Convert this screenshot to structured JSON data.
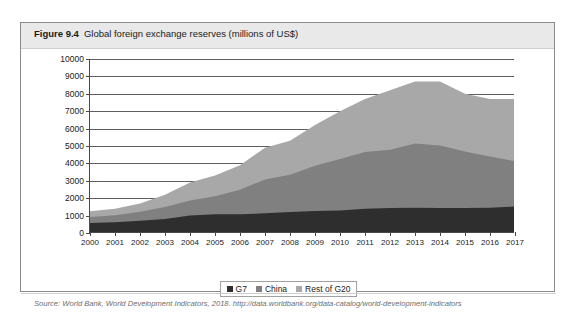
{
  "figure": {
    "number": "Figure 9.4",
    "caption": "Global foreign exchange reserves (millions of US$)",
    "source": "Source: World Bank, World Development Indicators, 2018. http://data.worldbank.org/data-catalog/world-development-indicators"
  },
  "legend": {
    "position": "bottom-center",
    "items": [
      {
        "label": "G7",
        "color": "#2e2e2e"
      },
      {
        "label": "China",
        "color": "#808080"
      },
      {
        "label": "Rest of G20",
        "color": "#a8a8a8"
      }
    ]
  },
  "chart_data": {
    "type": "area",
    "title": "Global foreign exchange reserves (millions of US$)",
    "xlabel": "",
    "ylabel": "",
    "stacked": true,
    "grid": true,
    "ylim": [
      0,
      10000
    ],
    "ytick_step": 1000,
    "ytick_labels": [
      "0",
      "1000",
      "2000",
      "3000",
      "4000",
      "5000",
      "6000",
      "7000",
      "8000",
      "9000",
      "10000"
    ],
    "categories": [
      "2000",
      "2001",
      "2002",
      "2003",
      "2004",
      "2005",
      "2006",
      "2007",
      "2008",
      "2009",
      "2010",
      "2011",
      "2012",
      "2013",
      "2014",
      "2015",
      "2016",
      "2017"
    ],
    "series": [
      {
        "name": "G7",
        "color": "#2e2e2e",
        "values": [
          580,
          620,
          700,
          800,
          1000,
          1080,
          1080,
          1130,
          1200,
          1260,
          1300,
          1400,
          1430,
          1450,
          1430,
          1430,
          1450,
          1520
        ]
      },
      {
        "name": "China",
        "color": "#808080",
        "values": [
          340,
          400,
          520,
          690,
          870,
          1030,
          1410,
          1950,
          2150,
          2600,
          2950,
          3250,
          3350,
          3700,
          3600,
          3250,
          2950,
          2600
        ]
      },
      {
        "name": "Rest of G20",
        "color": "#a8a8a8",
        "values": [
          330,
          380,
          480,
          710,
          1030,
          1190,
          1410,
          1820,
          1950,
          2340,
          2750,
          3050,
          3420,
          3550,
          3670,
          3320,
          3300,
          3580
        ]
      }
    ],
    "totals": [
      1250,
      1400,
      1700,
      2200,
      2900,
      3300,
      3900,
      4900,
      5300,
      6200,
      7000,
      7700,
      8200,
      8700,
      8700,
      8000,
      7700,
      7700
    ]
  }
}
